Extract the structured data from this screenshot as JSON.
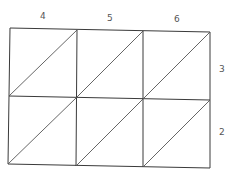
{
  "diagram": {
    "type": "lattice-multiplication-grid",
    "top_digits": [
      "4",
      "5",
      "6"
    ],
    "right_digits": [
      "3",
      "2"
    ],
    "rows": 2,
    "cols": 3,
    "cells_content": "empty",
    "colors": {
      "line": "#3a3a3a",
      "label": "#555555",
      "background": "#ffffff"
    }
  }
}
